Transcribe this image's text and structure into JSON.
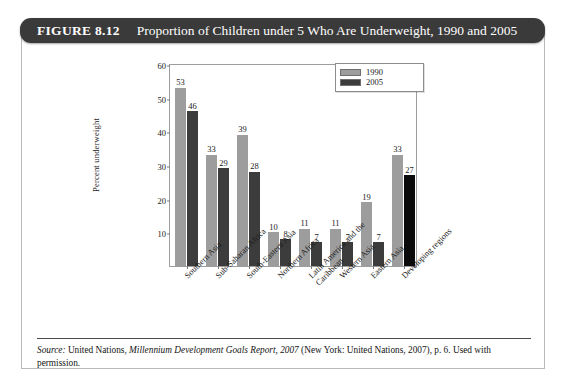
{
  "figure": {
    "number_label": "FIGURE 8.12",
    "title": "Proportion of Children under 5 Who Are Underweight, 1990 and 2005"
  },
  "source": {
    "label": "Source:",
    "text_part1": " United Nations, ",
    "italic_title": "Millennium Development Goals Report, 2007",
    "text_part2": " (New York: United Nations, 2007), p. 6. Used with permission."
  },
  "chart_data": {
    "type": "bar",
    "title": "Proportion of Children under 5 Who Are Underweight, 1990 and 2005",
    "xlabel": "",
    "ylabel": "Percent underweight",
    "ylim": [
      0,
      60
    ],
    "yticks": [
      10,
      20,
      30,
      40,
      50,
      60
    ],
    "grid": false,
    "legend_position": "top-right",
    "categories": [
      "Southern Asia",
      "Sub-Saharan Africa",
      "South-Eastern Asia",
      "Northern Africa",
      "Latin America and the Caribbean",
      "Western Asia",
      "Eastern Asia",
      "Developing regions"
    ],
    "series": [
      {
        "name": "1990",
        "color": "#9d9d9d",
        "values": [
          53,
          33,
          39,
          10,
          11,
          11,
          19,
          33
        ]
      },
      {
        "name": "2005",
        "color": "#3c3c3c",
        "values": [
          46,
          29,
          28,
          8,
          7,
          7,
          7,
          27
        ]
      }
    ]
  }
}
